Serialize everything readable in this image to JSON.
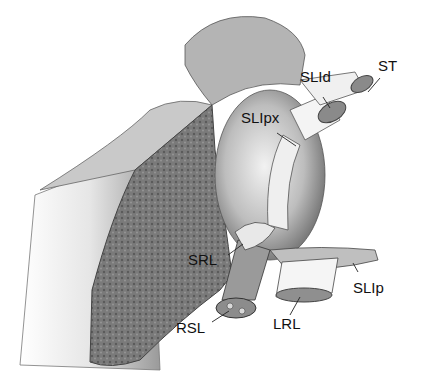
{
  "figure": {
    "type": "anatomical-illustration",
    "labels": [
      {
        "id": "ST",
        "text": "ST",
        "x": 378,
        "y": 70
      },
      {
        "id": "SLId",
        "text": "SLId",
        "x": 300,
        "y": 81
      },
      {
        "id": "SLIpx",
        "text": "SLIpx",
        "x": 241,
        "y": 110
      },
      {
        "id": "SRL",
        "text": "SRL",
        "x": 188,
        "y": 256
      },
      {
        "id": "SLIp",
        "text": "SLIp",
        "x": 353,
        "y": 281
      },
      {
        "id": "RSL",
        "text": "RSL",
        "x": 176,
        "y": 322
      },
      {
        "id": "LRL",
        "text": "LRL",
        "x": 273,
        "y": 314
      }
    ]
  }
}
